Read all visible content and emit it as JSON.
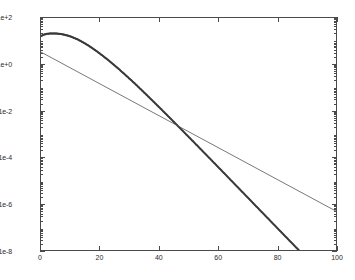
{
  "figure": {
    "background_color": "#ffffff",
    "axes_color": "#4a4a4a",
    "tick_label_color": "#2b2b2b"
  },
  "chart_data": {
    "type": "line",
    "title": "",
    "subtitle": "",
    "xlabel": "",
    "ylabel": "",
    "yscale": "log",
    "xscale": "linear",
    "grid": false,
    "legend": null,
    "legend_position": "none",
    "xlim": [
      0,
      100
    ],
    "ylim": [
      1e-08,
      100
    ],
    "x_ticks": [
      0,
      20,
      40,
      60,
      80,
      100
    ],
    "x_tick_labels": [
      "0",
      "20",
      "40",
      "60",
      "80",
      "100"
    ],
    "y_ticks": [
      100,
      1,
      0.01,
      0.0001,
      1e-06,
      1e-08
    ],
    "y_tick_labels": [
      "1e+2",
      "1e+0",
      "1e-2",
      "1e-4",
      "1e-6",
      "1e-8"
    ],
    "series": [
      {
        "name": "dotted-curve",
        "style": "dotted-markers",
        "color": "#3a3a3a",
        "marker": "dot",
        "marker_size": 2.0,
        "x": [
          0,
          1,
          2,
          3,
          4,
          5,
          6,
          7,
          8,
          9,
          10,
          11,
          12,
          13,
          14,
          15,
          16,
          17,
          18,
          19,
          20,
          21,
          22,
          23,
          24,
          25,
          26,
          27,
          28,
          29,
          30,
          31,
          32,
          33,
          34,
          35,
          36,
          37,
          38,
          39,
          40,
          41,
          42,
          43,
          44,
          45,
          46,
          47,
          48,
          49,
          50,
          51,
          52,
          53,
          54,
          55,
          56,
          57,
          58,
          59,
          60,
          61,
          62,
          63,
          64,
          65,
          66,
          67,
          68,
          69,
          70,
          71,
          72,
          73,
          74,
          75,
          76,
          77,
          78,
          79,
          80,
          81,
          82,
          83,
          84,
          85,
          86,
          87,
          88,
          89,
          90,
          91,
          92,
          93,
          94,
          95,
          96,
          97,
          98,
          99,
          100
        ],
        "y": [
          17.0,
          19.5,
          21.0,
          21.8,
          22.0,
          21.8,
          21.2,
          20.3,
          19.1,
          17.7,
          16.1,
          14.4,
          12.7,
          11.0,
          9.4,
          7.9,
          6.6,
          5.45,
          4.45,
          3.6,
          2.9,
          2.32,
          1.84,
          1.45,
          1.14,
          0.89,
          0.69,
          0.535,
          0.412,
          0.316,
          0.242,
          0.185,
          0.141,
          0.1065,
          0.0805,
          0.0607,
          0.0457,
          0.0344,
          0.0258,
          0.01935,
          0.01448,
          0.01082,
          0.00808,
          0.00603,
          0.0045,
          0.00335,
          0.0025,
          0.00186,
          0.00138,
          0.001027,
          0.000763,
          0.000567,
          0.000421,
          0.000312,
          0.000232,
          0.000172,
          0.0001275,
          9.45e-05,
          7e-05,
          5.19e-05,
          3.84e-05,
          2.85e-05,
          2.11e-05,
          1.56e-05,
          1.15e-05,
          8.5e-06,
          6.3e-06,
          4.66e-06,
          3.45e-06,
          2.55e-06,
          1.89e-06,
          1.4e-06,
          1.03e-06,
          7.6e-07,
          5.64e-07,
          4.17e-07,
          3.09e-07,
          2.28e-07,
          1.69e-07,
          1.25e-07,
          9.24e-08,
          6.84e-08,
          5.06e-08,
          3.74e-08,
          2.77e-08,
          2.05e-08,
          1.52e-08,
          1.12e-08,
          8.3e-09,
          6.14e-09,
          4.55e-09,
          3.37e-09,
          2.49e-09,
          1.85e-09,
          1.37e-09,
          1.01e-09,
          7.5e-10,
          5.56e-10,
          4.12e-10,
          3.05e-10,
          2.26e-10
        ]
      },
      {
        "name": "straight-line",
        "style": "solid-line",
        "color": "#555555",
        "line_width": 0.8,
        "x": [
          0,
          100
        ],
        "y": [
          3.5,
          5e-07
        ]
      }
    ],
    "annotations": []
  }
}
